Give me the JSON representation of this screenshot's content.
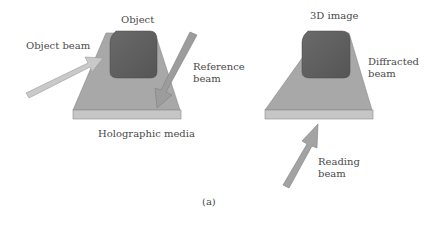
{
  "figure": {
    "label": "(a)",
    "left_panel": {
      "title": "Object",
      "object_beam_label": "Object beam",
      "reference_beam_label_line1": "Reference",
      "reference_beam_label_line2": "beam",
      "media_label": "Holographic media"
    },
    "right_panel": {
      "title": "3D image",
      "diffracted_beam_label_line1": "Diffracted",
      "diffracted_beam_label_line2": "beam",
      "reading_beam_label_line1": "Reading",
      "reading_beam_label_line2": "beam"
    },
    "colors": {
      "media_top": "#a9a9a9",
      "media_edge": "#c4c4c4",
      "object_block": "#5e5e5e",
      "arrow_light": "#c9c9c9",
      "arrow_dark": "#8f8f8f"
    }
  }
}
